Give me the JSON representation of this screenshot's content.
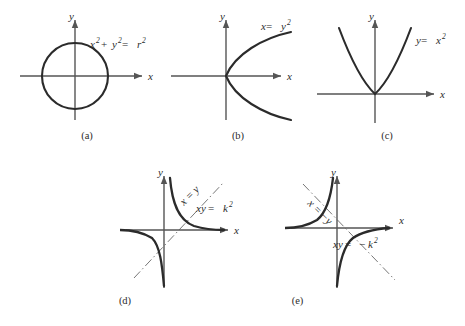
{
  "figure": {
    "title": "",
    "background_color": "#ffffff",
    "curve_color": "#2b2b2b",
    "axis_color": "#555555",
    "asymptote_color": "#777777",
    "panels": [
      {
        "id": "a",
        "caption": "(a)",
        "equation": "x² + y² = r²",
        "equation_parts": {
          "base": "x",
          "sup1": "2",
          "plus": " + ",
          "base2": "y",
          "sup2": "2",
          "eq": " = ",
          "base3": "r",
          "sup3": "2"
        },
        "curve_type": "circle",
        "x_axis_label": "x",
        "y_axis_label": "y",
        "description": "circle centered at origin of radius r"
      },
      {
        "id": "b",
        "caption": "(b)",
        "equation": "x = y²",
        "equation_parts": {
          "base": "x",
          "eq": " = ",
          "base2": "y",
          "sup2": "2"
        },
        "curve_type": "parabola-right",
        "x_axis_label": "x",
        "y_axis_label": "y",
        "description": "parabola opening to the right, vertex at origin"
      },
      {
        "id": "c",
        "caption": "(c)",
        "equation": "y = x²",
        "equation_parts": {
          "base": "y",
          "eq": " = ",
          "base2": "x",
          "sup2": "2"
        },
        "curve_type": "parabola-up",
        "x_axis_label": "x",
        "y_axis_label": "y",
        "description": "parabola opening upward, vertex at origin"
      },
      {
        "id": "d",
        "caption": "(d)",
        "equation": "xy = k²",
        "equation_parts": {
          "base": "xy",
          "eq": " = ",
          "base2": "k",
          "sup2": "2"
        },
        "asymptote_label": "x = y",
        "curve_type": "hyperbola-q1q3",
        "x_axis_label": "x",
        "y_axis_label": "y",
        "description": "rectangular hyperbola in quadrants I and III with dash-dot line x = y"
      },
      {
        "id": "e",
        "caption": "(e)",
        "equation": "xy = −k²",
        "equation_parts": {
          "base": "xy",
          "eq": " = ",
          "minus": "−",
          "base2": "k",
          "sup2": "2"
        },
        "asymptote_label": "x = −y",
        "curve_type": "hyperbola-q2q4",
        "x_axis_label": "x",
        "y_axis_label": "y",
        "description": "rectangular hyperbola in quadrants II and IV with dash-dot line x = -y"
      }
    ]
  }
}
